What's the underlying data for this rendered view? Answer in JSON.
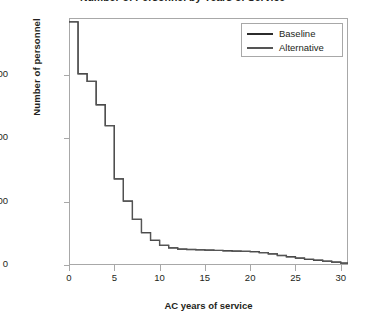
{
  "figure": {
    "title": "Number of Personnel by Years of Service",
    "title_truncated": true
  },
  "legend": {
    "position": "top-right-inside",
    "entries": [
      {
        "label": "Baseline",
        "color": "#2b2b2b",
        "swatch": "line-swatch-baseline"
      },
      {
        "label": "Alternative",
        "color": "#555555",
        "swatch": "line-swatch-alternative"
      }
    ]
  },
  "axes": {
    "y": {
      "label": "Number of personnel",
      "ticks": [
        "0",
        "10,000",
        "20,000",
        "30,000"
      ],
      "tick_values": [
        0,
        10000,
        20000,
        30000
      ],
      "range": [
        0,
        39000
      ]
    },
    "x": {
      "label": "AC years of service",
      "ticks": [
        "0",
        "5",
        "10",
        "15",
        "20",
        "25",
        "30"
      ],
      "tick_values": [
        0,
        5,
        10,
        15,
        20,
        25,
        30
      ],
      "range": [
        0,
        30.8
      ]
    }
  },
  "chart_data": {
    "type": "line",
    "subtype": "step",
    "title": "Number of Personnel by Years of Service",
    "xlabel": "AC years of service",
    "ylabel": "Number of personnel",
    "xlim": [
      0,
      30.8
    ],
    "ylim": [
      0,
      39000
    ],
    "grid": false,
    "legend_position": "upper right",
    "x": [
      0,
      1,
      2,
      3,
      4,
      5,
      6,
      7,
      8,
      9,
      10,
      11,
      12,
      13,
      14,
      15,
      16,
      17,
      18,
      19,
      20,
      21,
      22,
      23,
      24,
      25,
      26,
      27,
      28,
      29,
      30
    ],
    "series": [
      {
        "name": "Baseline",
        "color": "#2b2b2b",
        "values": [
          38400,
          30200,
          29000,
          25300,
          22000,
          13600,
          10100,
          7200,
          5100,
          3900,
          3100,
          2700,
          2500,
          2450,
          2400,
          2350,
          2300,
          2250,
          2200,
          2150,
          2100,
          1950,
          1750,
          1500,
          1300,
          1100,
          900,
          750,
          600,
          450,
          300
        ]
      },
      {
        "name": "Alternative",
        "color": "#555555",
        "values": [
          38400,
          30200,
          29000,
          25300,
          22000,
          13600,
          10100,
          7200,
          5100,
          3900,
          3100,
          2700,
          2500,
          2450,
          2400,
          2350,
          2300,
          2250,
          2200,
          2150,
          2100,
          1950,
          1750,
          1500,
          1300,
          1100,
          900,
          750,
          600,
          450,
          300
        ]
      }
    ]
  }
}
